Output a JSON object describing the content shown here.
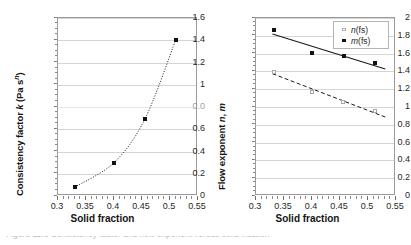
{
  "figure": {
    "caption_clipped": "Figure 11.3  Consistency factor and flow exponent versus solid fraction"
  },
  "chart_data": [
    {
      "id": "left",
      "type": "scatter",
      "title": "",
      "xlabel": "Solid fraction",
      "ylabel": "Consistency factor k (Pa sⁿ)",
      "ylabel_main": "Consistency factor ",
      "ylabel_symbol": "k",
      "ylabel_units": " (Pa s",
      "ylabel_exponent": "n",
      "ylabel_units_close": ")",
      "xlim": [
        0.3,
        0.55
      ],
      "ylim": [
        0,
        1.6
      ],
      "xticks": [
        0.3,
        0.35,
        0.4,
        0.45,
        0.5,
        0.55
      ],
      "xticklabels": [
        "0.3",
        "0.35",
        "0.4",
        "0.45",
        "0.5",
        "0.55"
      ],
      "yticks": [
        0,
        0.2,
        0.4,
        0.6,
        0.8,
        1.0,
        1.2,
        1.4,
        1.6
      ],
      "yticklabels": [
        "0",
        "0.2",
        "0.4",
        "0.6",
        "0.0",
        "1",
        "1.2",
        "1.4",
        "1.6"
      ],
      "ytick_degraded_index": 4,
      "ytick_degraded_note": "tick at 0.8 is rendered as 0.0 in the scanned source",
      "grid": true,
      "legend": false,
      "series": [
        {
          "name": "k",
          "marker": "filled-square",
          "line": "dotted",
          "x": [
            0.33,
            0.4,
            0.455,
            0.51
          ],
          "y": [
            0.08,
            0.3,
            0.69,
            1.4
          ]
        }
      ]
    },
    {
      "id": "right",
      "type": "scatter",
      "title": "",
      "xlabel": "Solid fraction",
      "ylabel": "Flow exponent n, m",
      "ylabel_main": "Flow exponent ",
      "ylabel_symbol_1": "n",
      "ylabel_sep": ", ",
      "ylabel_symbol_2": "m",
      "xlim": [
        0.3,
        0.55
      ],
      "ylim": [
        0,
        2
      ],
      "xticks": [
        0.3,
        0.35,
        0.4,
        0.45,
        0.5,
        0.55
      ],
      "xticklabels": [
        "0.3",
        "0.35",
        "0.4",
        "0.45",
        "0.5",
        "0.55"
      ],
      "yticks": [
        0,
        0.2,
        0.4,
        0.6,
        0.8,
        1.0,
        1.2,
        1.4,
        1.6,
        1.8,
        2.0
      ],
      "yticklabels": [
        "0",
        "0.2",
        "0.4",
        "0.6",
        "0.8",
        "1",
        "1.2",
        "1.4",
        "1.6",
        "1.8",
        "2"
      ],
      "grid": true,
      "legend": true,
      "legend_position": "top-right",
      "legend_entries": [
        {
          "label": "n(fs)",
          "symbol": "n",
          "suffix": "(fs)",
          "marker": "open-square",
          "line": "dashed"
        },
        {
          "label": "m(fs)",
          "symbol": "m",
          "suffix": "(fs)",
          "marker": "filled-square",
          "line": "solid"
        }
      ],
      "series": [
        {
          "name": "n(fs)",
          "marker": "open-square",
          "line": "dashed",
          "x": [
            0.333,
            0.4,
            0.455,
            0.513
          ],
          "y": [
            1.39,
            1.17,
            1.06,
            0.95
          ]
        },
        {
          "name": "m(fs)",
          "marker": "filled-square",
          "line": "solid",
          "x": [
            0.333,
            0.4,
            0.458,
            0.513
          ],
          "y": [
            1.86,
            1.61,
            1.57,
            1.49
          ]
        }
      ]
    }
  ]
}
